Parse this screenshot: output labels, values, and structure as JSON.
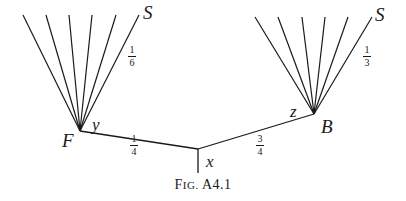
{
  "figure": {
    "caption_prefix_big": "F",
    "caption_prefix_small": "IG.",
    "caption_number": "A4.1"
  },
  "nodes": {
    "left_fan_node": "F",
    "right_fan_node": "B",
    "left_fan_top_label": "S",
    "right_fan_top_label": "S",
    "junction": "x",
    "left_angle": "y",
    "right_angle": "z"
  },
  "fractions": {
    "left_fan": {
      "num": "1",
      "den": "6"
    },
    "right_fan": {
      "num": "1",
      "den": "3"
    },
    "left_branch": {
      "num": "1",
      "den": "4"
    },
    "right_branch": {
      "num": "3",
      "den": "4"
    }
  },
  "geometry": {
    "left_apex": [
      80,
      131
    ],
    "right_apex": [
      314,
      114
    ],
    "junction": [
      198,
      149
    ],
    "stem_bottom": [
      198,
      173
    ],
    "left_fan_tops": [
      [
        23,
        15
      ],
      [
        46,
        15
      ],
      [
        69,
        15
      ],
      [
        92,
        15
      ],
      [
        116,
        15
      ],
      [
        139,
        15
      ]
    ],
    "right_fan_tops": [
      [
        255,
        17
      ],
      [
        278,
        17
      ],
      [
        302,
        17
      ],
      [
        325,
        17
      ],
      [
        348,
        17
      ],
      [
        372,
        17
      ]
    ],
    "stroke_color": "#1a1a1a"
  }
}
